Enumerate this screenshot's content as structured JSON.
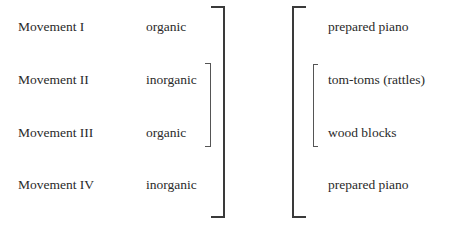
{
  "movements": [
    {
      "name": "Movement I",
      "type": "organic"
    },
    {
      "name": "Movement II",
      "type": "inorganic"
    },
    {
      "name": "Movement III",
      "type": "organic"
    },
    {
      "name": "Movement IV",
      "type": "inorganic"
    }
  ],
  "instruments": [
    "prepared piano",
    "tom-toms (rattles)",
    "wood blocks",
    "prepared piano"
  ]
}
